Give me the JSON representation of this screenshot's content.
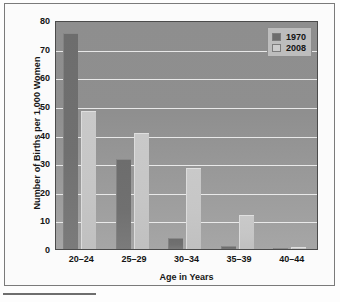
{
  "chart_data": {
    "type": "bar",
    "title": "",
    "subtitle": "",
    "xlabel": "Age in Years",
    "ylabel": "Number of Births per 1,000 Women",
    "categories": [
      "20–24",
      "25–29",
      "30–34",
      "35–39",
      "40–44"
    ],
    "series": [
      {
        "name": "1970",
        "color": "#6d6d6d",
        "values": [
          75.5,
          31.5,
          4.0,
          1.0,
          0.3
        ]
      },
      {
        "name": "2008",
        "color": "#c9c9c9",
        "values": [
          48.3,
          40.5,
          28.3,
          11.8,
          0.7
        ]
      }
    ],
    "ylim": [
      0,
      80
    ],
    "yticks": [
      0,
      10,
      20,
      30,
      40,
      50,
      60,
      70,
      80
    ],
    "ytick_labels": [
      "0",
      "10",
      "20",
      "30",
      "40",
      "50",
      "60",
      "70",
      "80"
    ],
    "grid": true,
    "grid_axis": "y",
    "legend_position": "top-right",
    "legend_entries": [
      "1970",
      "2008"
    ],
    "plot_background": "#909090",
    "gridline_color": "#f2f2f2",
    "frame_color": "#4b4b4b"
  },
  "figure": {
    "border_color": "#7a7a7a",
    "background": "#fbfbfb",
    "footnote_rule_color": "#6e6e6e"
  }
}
